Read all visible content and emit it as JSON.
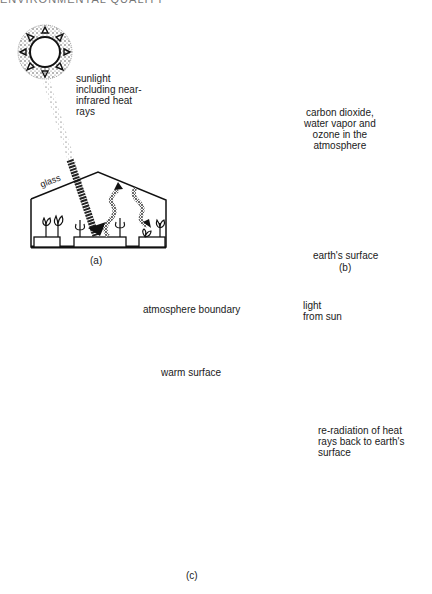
{
  "header": {
    "text": "ENVIRONMENTAL QUALITY"
  },
  "panel_a": {
    "caption": "(a)",
    "labels": {
      "sunlight": "sunlight\nincluding near-\ninfrared  heat\nrays",
      "glass": "glass"
    }
  },
  "panel_b": {
    "caption": "(b)",
    "labels": {
      "atmosphere": "carbon dioxide,\nwater vapor and\nozone in the\natmosphere",
      "surface": "earth's surface"
    }
  },
  "panel_c": {
    "caption": "(c)",
    "labels": {
      "boundary": "atmosphere boundary",
      "light": "light\nfrom sun",
      "warm": "warm surface",
      "reradiation": "re-radiation of heat\nrays back to earth's\nsurface"
    }
  },
  "colors": {
    "ink": "#1a1a1a",
    "stipple": "#555555",
    "background": "#ffffff"
  }
}
